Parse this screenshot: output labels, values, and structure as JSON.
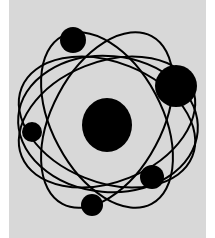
{
  "illustration": {
    "subject": "atom",
    "colors": {
      "page_background": "#ffffff",
      "panel_background": "#d8d8d8",
      "ink": "#000000"
    },
    "panel": {
      "x": 9,
      "y": 0,
      "width": 197,
      "height": 238
    },
    "nucleus": {
      "cx": 107,
      "cy": 125,
      "rx": 25,
      "ry": 27
    },
    "orbits": [
      {
        "cx": 107,
        "cy": 122,
        "rx": 92,
        "ry": 60,
        "rotate": -22
      },
      {
        "cx": 107,
        "cy": 122,
        "rx": 92,
        "ry": 60,
        "rotate": 22
      },
      {
        "cx": 107,
        "cy": 120,
        "rx": 95,
        "ry": 55,
        "rotate": 62
      },
      {
        "cx": 107,
        "cy": 120,
        "rx": 95,
        "ry": 55,
        "rotate": -62
      },
      {
        "cx": 108,
        "cy": 124,
        "rx": 90,
        "ry": 68,
        "rotate": 5
      }
    ],
    "stroke_width": 2,
    "electrons": [
      {
        "name": "electron-top",
        "cx": 73,
        "cy": 40,
        "r": 13
      },
      {
        "name": "electron-right-large",
        "cx": 176,
        "cy": 86,
        "r": 21
      },
      {
        "name": "electron-left",
        "cx": 32,
        "cy": 132,
        "r": 10
      },
      {
        "name": "electron-lower-right",
        "cx": 152,
        "cy": 177,
        "r": 12
      },
      {
        "name": "electron-bottom",
        "cx": 92,
        "cy": 205,
        "r": 11
      }
    ]
  }
}
